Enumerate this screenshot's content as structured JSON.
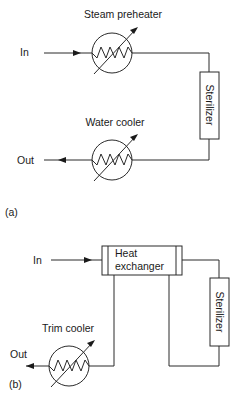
{
  "panel_a": {
    "label": "(a)",
    "inlet_label": "In",
    "outlet_label": "Out",
    "preheater": {
      "label": "Steam preheater",
      "type": "heat-exchanger-symbol"
    },
    "sterilizer": {
      "label": "Sterilizer"
    },
    "cooler": {
      "label": "Water cooler",
      "type": "heat-exchanger-symbol"
    }
  },
  "panel_b": {
    "label": "(b)",
    "inlet_label": "In",
    "outlet_label": "Out",
    "heat_exchanger": {
      "label_line1": "Heat",
      "label_line2": "exchanger"
    },
    "sterilizer": {
      "label": "Sterilizer"
    },
    "cooler": {
      "label": "Trim cooler",
      "type": "heat-exchanger-symbol"
    }
  },
  "colors": {
    "line": "#2a2a2a",
    "text": "#1a1a1a",
    "background": "#ffffff"
  }
}
